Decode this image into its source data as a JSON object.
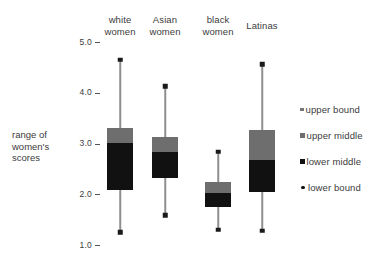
{
  "chart_data": {
    "type": "boxplot",
    "title": "",
    "xlabel": "",
    "ylabel": "range of women's scores",
    "ylabel_lines": [
      "range of",
      "women's",
      "scores"
    ],
    "ylim": [
      1.0,
      5.0
    ],
    "y_ticks": [
      {
        "value": 5.0,
        "label": "5.0"
      },
      {
        "value": 4.0,
        "label": "4.0"
      },
      {
        "value": 3.0,
        "label": "3.0"
      },
      {
        "value": 2.0,
        "label": "2.0"
      },
      {
        "value": 1.0,
        "label": "1.0"
      }
    ],
    "grid": false,
    "legend_position": "right",
    "categories": [
      "white women",
      "Asian women",
      "black women",
      "Latinas"
    ],
    "series": [
      {
        "name": "white women",
        "label_lines": [
          "white",
          "women"
        ],
        "upper_bound": 4.65,
        "upper_middle": 3.31,
        "median": 3.01,
        "lower_middle": 2.08,
        "lower_bound": 1.25
      },
      {
        "name": "Asian women",
        "label_lines": [
          "Asian",
          "women"
        ],
        "upper_bound": 4.13,
        "upper_middle": 3.13,
        "median": 2.83,
        "lower_middle": 2.32,
        "lower_bound": 1.59
      },
      {
        "name": "black women",
        "label_lines": [
          "black",
          "women"
        ],
        "upper_bound": 2.84,
        "upper_middle": 2.24,
        "median": 2.02,
        "lower_middle": 1.75,
        "lower_bound": 1.3
      },
      {
        "name": "Latinas",
        "label_lines": [
          "Latinas",
          ""
        ],
        "upper_bound": 4.56,
        "upper_middle": 3.26,
        "median": 2.67,
        "lower_middle": 2.04,
        "lower_bound": 1.28
      }
    ],
    "legend": [
      {
        "key": "upper-bound",
        "label": "upper bound",
        "color": "#777777",
        "shape": "small-square"
      },
      {
        "key": "upper-middle",
        "label": "upper middle",
        "color": "#6e6e6e",
        "shape": "square"
      },
      {
        "key": "lower-middle",
        "label": "lower middle",
        "color": "#111111",
        "shape": "square"
      },
      {
        "key": "lower-bound",
        "label": "lower bound",
        "color": "#111111",
        "shape": "dot"
      }
    ],
    "colors": {
      "upper_box": "#6e6e6e",
      "lower_box": "#111111",
      "whisker": "#8e8e8e",
      "cap": "#1a1a1a",
      "text": "#3c3c3c",
      "background": "#ffffff"
    }
  },
  "geometry": {
    "y_top_value": 5.0,
    "y_bottom_value": 1.0,
    "y_top_px": 42,
    "y_bottom_px": 245,
    "box_width": 26,
    "series_x": [
      120,
      165,
      218,
      262
    ],
    "header_y": 14,
    "legend_y": [
      108,
      135,
      160,
      186
    ]
  }
}
